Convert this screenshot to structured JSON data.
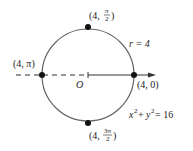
{
  "diagram": {
    "origin_label": "O",
    "radius_label": "r = 4",
    "equation": {
      "base_x": "x",
      "exp_x": "2",
      "plus": " + ",
      "base_y": "y",
      "exp_y": "2",
      "rhs": " = 16"
    },
    "points": [
      {
        "id": "top",
        "prefix": "(4, ",
        "num": "π",
        "den": "2",
        "suffix": ")"
      },
      {
        "id": "left",
        "text": "(4, π)"
      },
      {
        "id": "right",
        "text": "(4, 0)"
      },
      {
        "id": "bottom",
        "prefix": "(4, ",
        "num": "3π",
        "den": "2",
        "suffix": ")"
      }
    ],
    "colors": {
      "circle": "#666666",
      "line": "#333333",
      "dot": "#111111"
    }
  }
}
